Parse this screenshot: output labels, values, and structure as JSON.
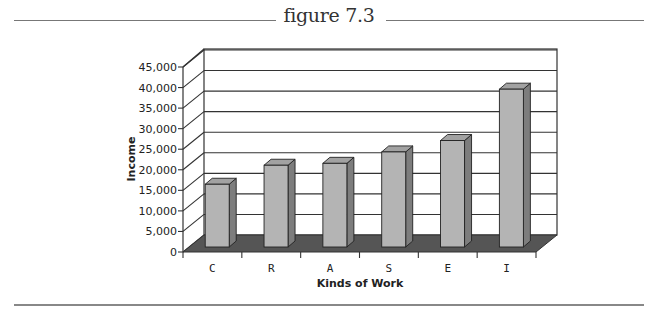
{
  "figure": {
    "title": "figure 7.3"
  },
  "colors": {
    "bar_front": "#b4b4b4",
    "bar_top": "#a2a2a2",
    "bar_side": "#7d7d7d",
    "floor": "#555555",
    "grid": "#333333",
    "rule": "#888888"
  },
  "chart_data": {
    "type": "bar",
    "title": "figure 7.3",
    "xlabel": "Kinds of Work",
    "ylabel": "Income",
    "categories": [
      "C",
      "R",
      "A",
      "S",
      "E",
      "I"
    ],
    "values": [
      16500,
      21500,
      22000,
      25000,
      28000,
      41500
    ],
    "ylim": [
      0,
      45000
    ],
    "yticks": [
      0,
      5000,
      10000,
      15000,
      20000,
      25000,
      30000,
      35000,
      40000,
      45000
    ],
    "ytick_labels": [
      "0",
      "5,000",
      "10,000",
      "15,000",
      "20,000",
      "25,000",
      "30,000",
      "35,000",
      "40,000",
      "45,000"
    ],
    "grid": true,
    "style": "3d-column",
    "legend": null
  }
}
